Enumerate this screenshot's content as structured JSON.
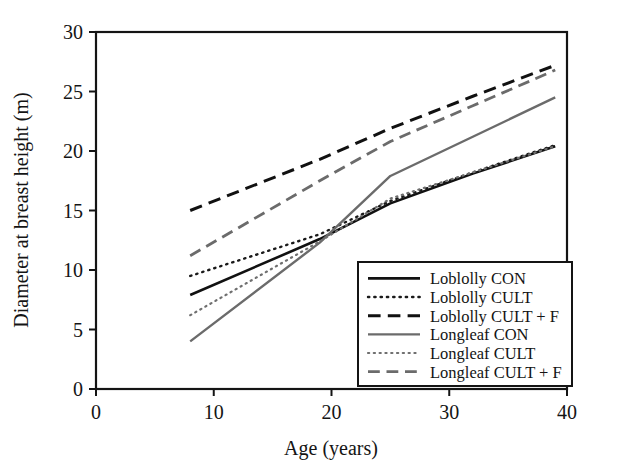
{
  "chart_data": {
    "type": "line",
    "title": "",
    "xlabel": "Age (years)",
    "ylabel": "Diameter at breast height (m)",
    "xlim": [
      0,
      40
    ],
    "ylim": [
      0,
      30
    ],
    "xticks": [
      "0",
      "10",
      "20",
      "30",
      "40"
    ],
    "xtick_values": [
      0,
      10,
      20,
      30,
      40
    ],
    "yticks": [
      "0",
      "5",
      "10",
      "15",
      "20",
      "25",
      "30"
    ],
    "ytick_values": [
      0,
      5,
      10,
      15,
      20,
      25,
      30
    ],
    "grid": false,
    "legend_position": "lower right",
    "series": [
      {
        "name": "Loblolly CON",
        "style": "solid",
        "color": "#111111",
        "width": 2.6,
        "x": [
          8,
          19,
          25,
          32,
          39
        ],
        "y": [
          7.9,
          12.6,
          15.6,
          18.1,
          20.4
        ]
      },
      {
        "name": "Loblolly CULT",
        "style": "dotted",
        "color": "#1a1a1a",
        "width": 2.4,
        "x": [
          8,
          19,
          25,
          32,
          39
        ],
        "y": [
          9.5,
          13.0,
          15.8,
          18.2,
          20.5
        ]
      },
      {
        "name": "Loblolly CULT + F",
        "style": "dashed",
        "color": "#111111",
        "width": 3.0,
        "x": [
          8,
          19,
          25,
          32,
          39
        ],
        "y": [
          15.0,
          19.3,
          21.9,
          24.6,
          27.2
        ]
      },
      {
        "name": "Longleaf CON",
        "style": "solid",
        "color": "#6b6b6b",
        "width": 2.4,
        "x": [
          8,
          19,
          25,
          32,
          39
        ],
        "y": [
          4.0,
          12.3,
          17.9,
          21.2,
          24.5
        ]
      },
      {
        "name": "Longleaf CULT",
        "style": "dotted",
        "color": "#6f6f6f",
        "width": 2.2,
        "x": [
          8,
          19,
          25,
          32,
          39
        ],
        "y": [
          6.2,
          12.4,
          16.0,
          18.2,
          20.4
        ]
      },
      {
        "name": "Longleaf CULT + F",
        "style": "dashed",
        "color": "#6b6b6b",
        "width": 2.8,
        "x": [
          8,
          19,
          25,
          32,
          39
        ],
        "y": [
          11.2,
          17.5,
          20.8,
          23.8,
          26.8
        ]
      }
    ],
    "legend_entries": [
      {
        "label": "Loblolly CON",
        "style": "solid",
        "color": "#111111"
      },
      {
        "label": "Loblolly CULT",
        "style": "dotted",
        "color": "#1a1a1a"
      },
      {
        "label": "Loblolly CULT + F",
        "style": "dashed",
        "color": "#111111"
      },
      {
        "label": "Longleaf CON",
        "style": "solid",
        "color": "#6b6b6b"
      },
      {
        "label": "Longleaf CULT",
        "style": "dotted",
        "color": "#6f6f6f"
      },
      {
        "label": "Longleaf CULT + F",
        "style": "dashed",
        "color": "#6b6b6b"
      }
    ],
    "axis_color": "#141414"
  }
}
